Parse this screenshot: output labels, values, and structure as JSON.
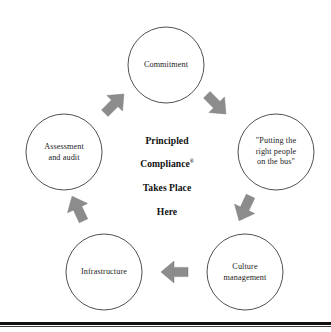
{
  "diagram": {
    "center": {
      "line1": "Principled",
      "line2": "Compliance",
      "mark": "®",
      "line3": "Takes Place",
      "line4": "Here",
      "full_text": "Principled Compliance® Takes Place Here"
    },
    "style": {
      "circle_stroke": "#3d3d3d",
      "circle_fill": "#ffffff",
      "arrow_fill": "#8c8c8c",
      "arrow_stroke": "#7a7a7a",
      "text_color": "#1c1c1c",
      "rule_color": "#111111",
      "background": "#ffffff"
    },
    "nodes": [
      {
        "id": "commitment",
        "label": "Commitment",
        "position": "top",
        "cx": 166,
        "cy": 65,
        "r": 38
      },
      {
        "id": "right-people",
        "label": "\"Putting the\nright people\non the bus\"",
        "position": "upper-right",
        "cx": 276,
        "cy": 152,
        "r": 38
      },
      {
        "id": "culture-management",
        "label": "Culture\nmanagement",
        "position": "lower-right",
        "cx": 245,
        "cy": 272,
        "r": 38
      },
      {
        "id": "infrastructure",
        "label": "Infrastructure",
        "position": "lower-left",
        "cx": 104,
        "cy": 272,
        "r": 38
      },
      {
        "id": "assessment-and-audit",
        "label": "Assessment\nand audit",
        "position": "upper-left",
        "cx": 64,
        "cy": 152,
        "r": 38
      }
    ],
    "arrows": [
      {
        "id": "arrow-commitment-to-people",
        "from": "commitment",
        "to": "right-people",
        "direction": "down-right",
        "cx": 216,
        "cy": 104,
        "angle_deg": 135
      },
      {
        "id": "arrow-people-to-culture",
        "from": "right-people",
        "to": "culture-management",
        "direction": "down-left",
        "cx": 245,
        "cy": 208,
        "angle_deg": 205
      },
      {
        "id": "arrow-culture-to-infrastructure",
        "from": "culture-management",
        "to": "infrastructure",
        "direction": "left",
        "cx": 175,
        "cy": 272,
        "angle_deg": 270
      },
      {
        "id": "arrow-infrastructure-to-assessment",
        "from": "infrastructure",
        "to": "assessment-and-audit",
        "direction": "up-left",
        "cx": 78,
        "cy": 209,
        "angle_deg": 335
      },
      {
        "id": "arrow-assessment-to-commitment",
        "from": "assessment-and-audit",
        "to": "commitment",
        "direction": "up-right",
        "cx": 114,
        "cy": 104,
        "angle_deg": 45
      }
    ]
  }
}
